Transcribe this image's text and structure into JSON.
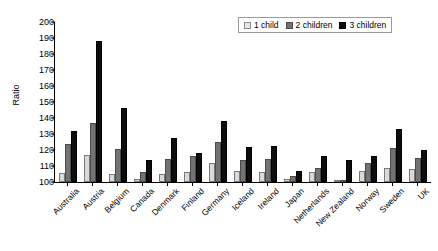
{
  "chart_data": {
    "type": "bar",
    "title": "",
    "xlabel": "",
    "ylabel": "Ratio",
    "ylim": [
      100,
      200
    ],
    "ytick_step": 10,
    "grid": false,
    "legend_position": "top-right",
    "categories": [
      "Australia",
      "Austria",
      "Belgium",
      "Canada",
      "Denmark",
      "Finland",
      "Germany",
      "Iceland",
      "Ireland",
      "Japan",
      "Netherlands",
      "New Zealand",
      "Norway",
      "Sweden",
      "UK"
    ],
    "yticks": [
      "100",
      "110",
      "120",
      "130",
      "140",
      "150",
      "160",
      "170",
      "180",
      "190",
      "200"
    ],
    "series": [
      {
        "name": "1 child",
        "color": "#d9d9d9",
        "values": [
          105.5,
          117.0,
          105.0,
          102.0,
          105.0,
          106.0,
          112.0,
          107.0,
          106.0,
          102.0,
          106.0,
          100.3,
          107.0,
          109.0,
          108.0
        ]
      },
      {
        "name": "2 children",
        "color": "#737373",
        "values": [
          123.5,
          137.0,
          120.5,
          106.0,
          114.5,
          116.0,
          125.0,
          114.0,
          114.5,
          104.0,
          109.0,
          100.3,
          112.0,
          121.0,
          115.0
        ]
      },
      {
        "name": "3 children",
        "color": "#0d0d0d",
        "values": [
          132.0,
          188.0,
          146.0,
          113.5,
          127.5,
          118.0,
          138.0,
          122.0,
          122.5,
          107.0,
          116.0,
          114.0,
          116.0,
          133.0,
          120.0
        ]
      }
    ]
  },
  "legend": {
    "items": [
      {
        "label": "1 child"
      },
      {
        "label": "2 children"
      },
      {
        "label": "3 children"
      }
    ]
  }
}
